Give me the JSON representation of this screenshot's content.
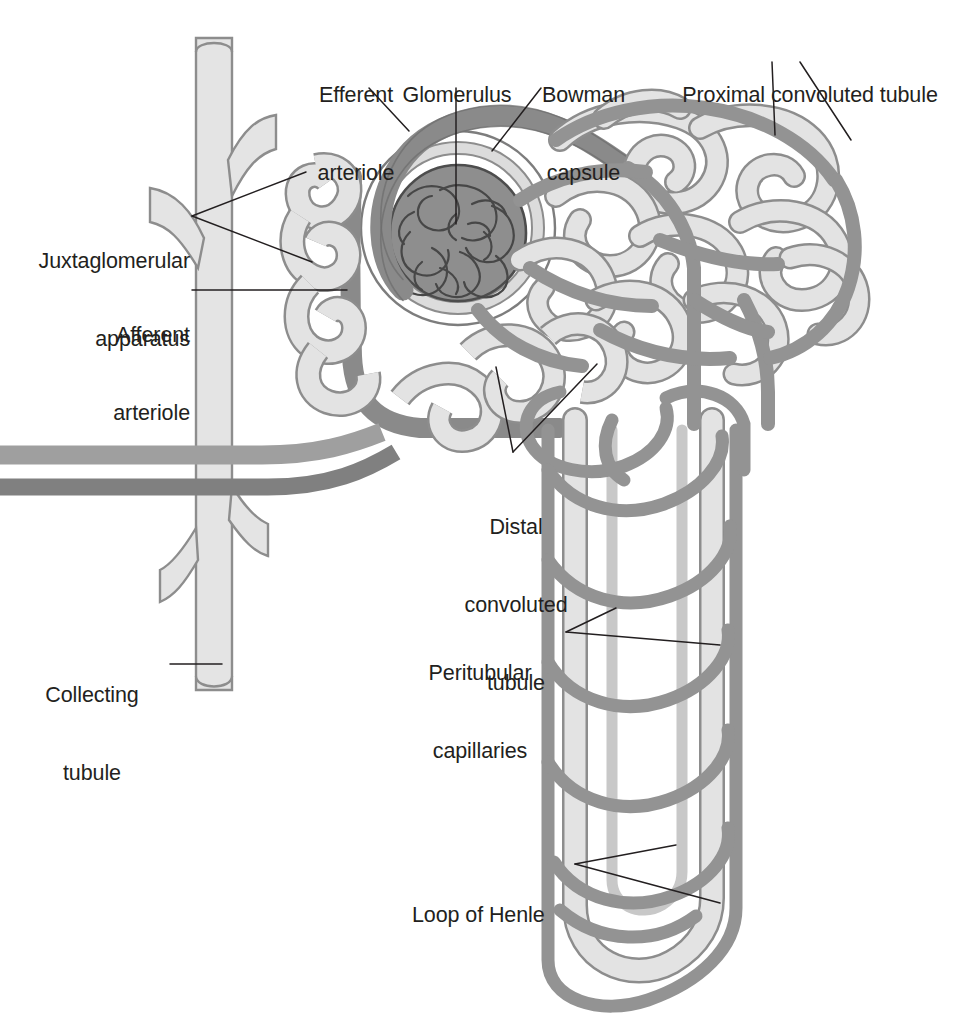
{
  "figure": {
    "type": "anatomical-diagram",
    "background_color": "#ffffff"
  },
  "palette": {
    "tubule_fill": "#e3e3e3",
    "tubule_stroke": "#6e6e6e",
    "capillary_fill": "#949494",
    "capillary_stroke": "#6a6a6a",
    "arteriole_dark": "#8a8a8a",
    "arteriole_light": "#9f9f9f",
    "glomerulus_fill": "#8e8e8e",
    "glomerulus_stroke": "#4a4a4a",
    "bowman_capsule_fill": "#dcdcdc",
    "collecting_tubule_fill": "#e4e4e4",
    "leader_line": "#231f20",
    "label_text": "#231f20"
  },
  "labels": [
    {
      "id": "efferent-arteriole",
      "lines": [
        "Efferent",
        "arteriole"
      ],
      "x": 302,
      "y": 30,
      "width": 108,
      "align": "center"
    },
    {
      "id": "glomerulus",
      "lines": [
        "Glomerulus"
      ],
      "x": 396,
      "y": 30,
      "width": 122,
      "align": "center"
    },
    {
      "id": "bowman-capsule",
      "lines": [
        "Bowman",
        "capsule"
      ],
      "x": 533,
      "y": 30,
      "width": 101,
      "align": "center"
    },
    {
      "id": "proximal-convoluted-tubule",
      "lines": [
        "Proximal convoluted tubule"
      ],
      "x": 673,
      "y": 30,
      "width": 274,
      "align": "center"
    },
    {
      "id": "juxtaglomerular-apparatus",
      "lines": [
        "Juxtaglomerular",
        "apparatus"
      ],
      "x": 20,
      "y": 196,
      "width": 170,
      "align": "right"
    },
    {
      "id": "afferent-arteriole",
      "lines": [
        "Afferent",
        "arteriole"
      ],
      "x": 20,
      "y": 270,
      "width": 170,
      "align": "right"
    },
    {
      "id": "distal-convoluted-tubule",
      "lines": [
        "Distal",
        "convoluted",
        "tubule"
      ],
      "x": 451,
      "y": 462,
      "width": 130,
      "align": "center"
    },
    {
      "id": "peritubular-capillaries",
      "lines": [
        "Peritubular",
        "capillaries"
      ],
      "x": 404,
      "y": 608,
      "width": 152,
      "align": "center"
    },
    {
      "id": "collecting-tubule",
      "lines": [
        "Collecting",
        "tubule"
      ],
      "x": 22,
      "y": 630,
      "width": 140,
      "align": "center"
    },
    {
      "id": "loop-of-henle",
      "lines": [
        "Loop of Henle"
      ],
      "x": 412,
      "y": 850,
      "width": 155,
      "align": "left"
    }
  ],
  "leader_lines": [
    {
      "id": "efferent-arteriole-leader",
      "points": "369,88 409,131"
    },
    {
      "id": "glomerulus-leader",
      "points": "456,88 456,224"
    },
    {
      "id": "bowman-capsule-leader",
      "points": "541,88 492,151"
    },
    {
      "id": "proximal-leader-left",
      "points": "772,62 775,135"
    },
    {
      "id": "proximal-leader-right",
      "points": "800,62 851,140"
    },
    {
      "id": "juxtaglomerular-leader-upper",
      "points": "192,216 306,172"
    },
    {
      "id": "juxtaglomerular-leader-lower",
      "points": "192,216 312,262"
    },
    {
      "id": "afferent-arteriole-leader",
      "points": "192,290 347,290"
    },
    {
      "id": "distal-leader-left",
      "points": "513,452 496,367"
    },
    {
      "id": "distal-leader-right",
      "points": "513,452 597,364"
    },
    {
      "id": "peritubular-leader-upper",
      "points": "566,632 616,608"
    },
    {
      "id": "peritubular-leader-lower",
      "points": "566,632 720,645"
    },
    {
      "id": "collecting-tubule-leader",
      "points": "170,664 222,664"
    },
    {
      "id": "loop-leader-upper",
      "points": "575,864 676,845"
    },
    {
      "id": "loop-leader-lower",
      "points": "575,864 720,903"
    }
  ]
}
